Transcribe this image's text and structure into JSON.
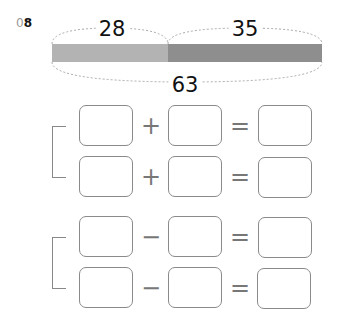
{
  "problem": {
    "number_prefix": "0",
    "number_digit": "8"
  },
  "tape_diagram": {
    "part1": {
      "value": "28",
      "color": "#b3b3b3"
    },
    "part2": {
      "value": "35",
      "color": "#8e8e8e"
    },
    "total": {
      "value": "63"
    }
  },
  "equations": [
    {
      "group": "addition",
      "operator": "+",
      "equals": "=",
      "boxes": [
        "",
        "",
        ""
      ]
    },
    {
      "group": "addition",
      "operator": "+",
      "equals": "=",
      "boxes": [
        "",
        "",
        ""
      ]
    },
    {
      "group": "subtraction",
      "operator": "−",
      "equals": "=",
      "boxes": [
        "",
        "",
        ""
      ]
    },
    {
      "group": "subtraction",
      "operator": "−",
      "equals": "=",
      "boxes": [
        "",
        "",
        ""
      ]
    }
  ]
}
